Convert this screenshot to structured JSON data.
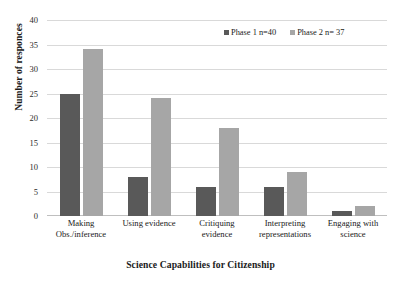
{
  "chart_data": {
    "type": "bar",
    "title": "",
    "xlabel": "Science Capabilities for Citizenship",
    "ylabel": "Number of responces",
    "categories": [
      "Making Obs./inference",
      "Using evidence",
      "Critiquing evidence",
      "Interpreting representations",
      "Engaging with science"
    ],
    "category_lines": [
      [
        "Making",
        "Obs./inference"
      ],
      [
        "Using evidence",
        ""
      ],
      [
        "Critiquing",
        "evidence"
      ],
      [
        "Interpreting",
        "representations"
      ],
      [
        "Engaging with",
        "science"
      ]
    ],
    "series": [
      {
        "name": "Phase 1  n=40",
        "color": "#595959",
        "values": [
          25,
          8,
          6,
          6,
          1
        ]
      },
      {
        "name": "Phase 2 n= 37",
        "color": "#a6a6a6",
        "values": [
          34,
          24,
          18,
          9,
          2
        ]
      }
    ],
    "ylim": [
      0,
      40
    ],
    "ytick_values": [
      0,
      5,
      10,
      15,
      20,
      25,
      30,
      35,
      40
    ],
    "ytick_labels": [
      "0",
      "5",
      "10",
      "15",
      "20",
      "25",
      "30",
      "35",
      "40"
    ],
    "grid": true,
    "grid_axis": "y",
    "grid_color": "#d9d9d9",
    "legend_position": "top-right",
    "background": "#ffffff"
  },
  "legend": {
    "items": [
      {
        "label": "Phase 1  n=40",
        "color": "#595959"
      },
      {
        "label": "Phase 2 n= 37",
        "color": "#a6a6a6"
      }
    ]
  }
}
